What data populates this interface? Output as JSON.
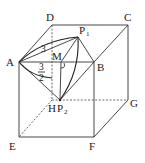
{
  "diagram": {
    "type": "cube-geometry",
    "vertices": {
      "A": {
        "label": "A",
        "x": 19,
        "y": 62
      },
      "B": {
        "label": "B",
        "x": 94,
        "y": 63
      },
      "C": {
        "label": "C",
        "x": 128,
        "y": 25
      },
      "D": {
        "label": "D",
        "x": 52,
        "y": 25
      },
      "E": {
        "label": "E",
        "x": 19,
        "y": 137
      },
      "F": {
        "label": "F",
        "x": 94,
        "y": 137
      },
      "G": {
        "label": "G",
        "x": 128,
        "y": 100
      },
      "H": {
        "label": "H",
        "x": 52,
        "y": 100
      }
    },
    "points": {
      "M": {
        "label": "M",
        "x": 61,
        "y": 63
      },
      "P1": {
        "label": "P",
        "sub": "1",
        "x": 78,
        "y": 37
      },
      "P2": {
        "label": "P",
        "sub": "2",
        "x": 60,
        "y": 100
      }
    },
    "annotations": {
      "AP1_length": "3",
      "AM_fraction_num": "3",
      "AM_fraction_den": "2"
    }
  }
}
